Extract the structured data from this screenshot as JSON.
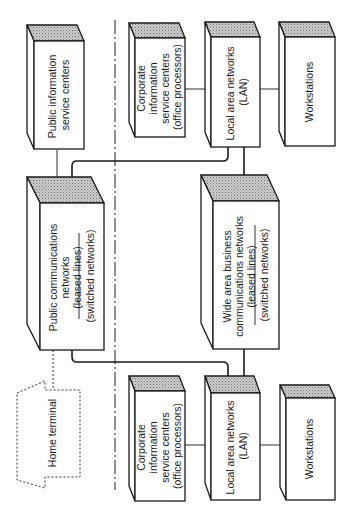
{
  "diagram": {
    "orientation": "rotated 90deg counter-clockwise",
    "nodes": {
      "public_info_centers": {
        "lines": [
          "Public information",
          "service centers"
        ]
      },
      "public_comm_networks": {
        "lines": [
          "Public communications",
          "networks",
          "(leased lines)",
          "(switched networks)"
        ]
      },
      "home_terminal": {
        "lines": [
          "Home terminal"
        ]
      },
      "corp_info_centers_top": {
        "lines": [
          "Corporate",
          "information",
          "service centers",
          "(office processors)"
        ]
      },
      "lan_top": {
        "lines": [
          "Local area networks",
          "(LAN)"
        ]
      },
      "workstations_top": {
        "lines": [
          "Workstations"
        ]
      },
      "wan_business": {
        "lines": [
          "Wide area business",
          "communications networks",
          "(leased lines)",
          "(switched networks)"
        ]
      },
      "corp_info_centers_bottom": {
        "lines": [
          "Corporate",
          "information",
          "service centers",
          "(office processors)"
        ]
      },
      "lan_bottom": {
        "lines": [
          "Local area networks",
          "(LAN)"
        ]
      },
      "workstations_bottom": {
        "lines": [
          "Workstations"
        ]
      }
    },
    "edges": [
      [
        "public_info_centers",
        "public_comm_networks"
      ],
      [
        "public_comm_networks",
        "lan_top"
      ],
      [
        "public_comm_networks",
        "lan_bottom"
      ],
      [
        "public_comm_networks",
        "home_terminal"
      ],
      [
        "corp_info_centers_top",
        "lan_top"
      ],
      [
        "lan_top",
        "workstations_top"
      ],
      [
        "lan_top",
        "wan_business"
      ],
      [
        "wan_business",
        "lan_bottom"
      ],
      [
        "corp_info_centers_bottom",
        "lan_bottom"
      ],
      [
        "lan_bottom",
        "workstations_bottom"
      ]
    ]
  }
}
